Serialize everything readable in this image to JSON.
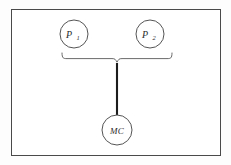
{
  "figure": {
    "type": "diagram",
    "title": "",
    "background_color": "#fdfdfd",
    "frame_color": "#4a4a4a",
    "line_color": "#555555",
    "trunk_color": "#1c1c1c"
  },
  "nodes": {
    "p1": {
      "id": "P1",
      "label_main": "P",
      "label_sub": "1",
      "cx": 74,
      "cy": 34,
      "r": 14
    },
    "p2": {
      "id": "P2",
      "label_main": "P",
      "label_sub": "2",
      "cx": 150,
      "cy": 34,
      "r": 14
    },
    "mc": {
      "id": "MC",
      "label_main": "MC",
      "label_sub": "",
      "cx": 117,
      "cy": 130,
      "r": 15
    }
  },
  "connectors": {
    "brace": {
      "name": "aggregation-brace",
      "left_x": 62,
      "right_x": 172,
      "y": 59,
      "center_x": 117
    },
    "trunk": {
      "name": "vertical-connector",
      "x": 117,
      "y_top": 64,
      "y_bottom": 115
    }
  }
}
